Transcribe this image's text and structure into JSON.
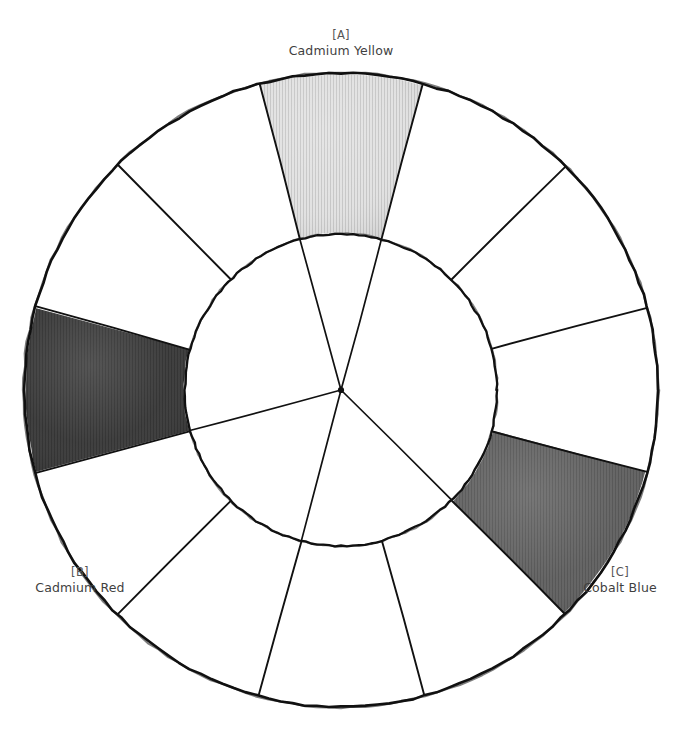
{
  "figure": {
    "kind": "color-wheel-diagram",
    "background_color": "#ffffff",
    "ink_color": "#111111",
    "label_color": "#3f3f3f"
  },
  "chart_data": {
    "type": "pie",
    "title": "",
    "subtitle": "",
    "xlabel": "",
    "ylabel": "",
    "legend_position": "none",
    "grid": false,
    "geometry": {
      "center_x": 341,
      "center_y": 390,
      "outer_radius": 317,
      "inner_radius": 156,
      "sector_count": 12,
      "sector_span_degrees": 30,
      "ring_start_angle_degrees": -105,
      "inner_spoke_angles_degrees": [
        -105,
        -75,
        45,
        105,
        165
      ]
    },
    "categories": [
      "sector-1",
      "sector-2",
      "sector-3",
      "sector-4",
      "sector-5",
      "sector-6",
      "sector-7",
      "sector-8",
      "sector-9",
      "sector-10",
      "sector-11",
      "sector-12"
    ],
    "values": [
      30,
      30,
      30,
      30,
      30,
      30,
      30,
      30,
      30,
      30,
      30,
      30
    ],
    "sectors": [
      {
        "index": 1,
        "start_deg": -105,
        "end_deg": -75,
        "fill": "#d8d8d8",
        "filled": true,
        "key": "[A]",
        "name": "Cadmium Yellow"
      },
      {
        "index": 2,
        "start_deg": -75,
        "end_deg": -45,
        "fill": "#ffffff",
        "filled": false,
        "key": "",
        "name": ""
      },
      {
        "index": 3,
        "start_deg": -45,
        "end_deg": -15,
        "fill": "#ffffff",
        "filled": false,
        "key": "",
        "name": ""
      },
      {
        "index": 4,
        "start_deg": -15,
        "end_deg": 15,
        "fill": "#ffffff",
        "filled": false,
        "key": "",
        "name": ""
      },
      {
        "index": 5,
        "start_deg": 15,
        "end_deg": 45,
        "fill": "#5b5b5b",
        "filled": true,
        "key": "[C]",
        "name": "Cobalt Blue"
      },
      {
        "index": 6,
        "start_deg": 45,
        "end_deg": 75,
        "fill": "#ffffff",
        "filled": false,
        "key": "",
        "name": ""
      },
      {
        "index": 7,
        "start_deg": 75,
        "end_deg": 105,
        "fill": "#ffffff",
        "filled": false,
        "key": "",
        "name": ""
      },
      {
        "index": 8,
        "start_deg": 105,
        "end_deg": 135,
        "fill": "#ffffff",
        "filled": false,
        "key": "",
        "name": ""
      },
      {
        "index": 9,
        "start_deg": 135,
        "end_deg": 165,
        "fill": "#ffffff",
        "filled": false,
        "key": "",
        "name": ""
      },
      {
        "index": 10,
        "start_deg": 165,
        "end_deg": 195,
        "fill": "#333333",
        "filled": true,
        "key": "[B]",
        "name": "Cadmium Red"
      },
      {
        "index": 11,
        "start_deg": 195,
        "end_deg": 225,
        "fill": "#ffffff",
        "filled": false,
        "key": "",
        "name": ""
      },
      {
        "index": 12,
        "start_deg": 225,
        "end_deg": 255,
        "fill": "#ffffff",
        "filled": false,
        "key": "",
        "name": ""
      }
    ]
  },
  "labels": {
    "a": {
      "key": "[A]",
      "name": "Cadmium Yellow"
    },
    "b": {
      "key": "[B]",
      "name": "Cadmium Red"
    },
    "c": {
      "key": "[C]",
      "name": "Cobalt Blue"
    }
  },
  "colors": {
    "cadmium_yellow_swatch": "#d8d8d8",
    "cadmium_red_swatch": "#333333",
    "cobalt_blue_swatch": "#5b5b5b",
    "ink": "#111111",
    "paper": "#ffffff"
  }
}
